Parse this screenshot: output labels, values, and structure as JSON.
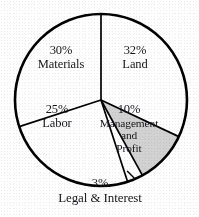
{
  "chart_data": {
    "type": "pie",
    "title": "",
    "subtitle": "",
    "xlabel": "",
    "ylabel": "",
    "legend_position": "none",
    "grid": false,
    "labels_inside": true,
    "total": 100,
    "units": "percent",
    "categories": [
      "Land",
      "Management and Profit",
      "Legal & Interest",
      "Labor",
      "Materials"
    ],
    "values": [
      32,
      10,
      3,
      25,
      30
    ],
    "start_angle_deg": 0,
    "direction": "clockwise",
    "slices": [
      {
        "name": "Land",
        "percent_text": "32%",
        "label_text": "Land",
        "value": 32,
        "fill": "#ffffff",
        "stroke": "#000000",
        "label_position": "inside"
      },
      {
        "name": "Management and Profit",
        "percent_text": "10%",
        "label_text": "Management and Profit",
        "label_line1": "Management",
        "label_line2": "and",
        "label_line3": "Profit",
        "value": 10,
        "fill": "#d2d2d2",
        "stroke": "#000000",
        "label_position": "inside"
      },
      {
        "name": "Legal & Interest",
        "percent_text": "3%",
        "label_text": "Legal & Interest",
        "value": 3,
        "fill": "#ffffff",
        "stroke": "#000000",
        "label_position": "outside-bottom"
      },
      {
        "name": "Labor",
        "percent_text": "25%",
        "label_text": "Labor",
        "value": 25,
        "fill": "#ffffff",
        "stroke": "#000000",
        "label_position": "inside"
      },
      {
        "name": "Materials",
        "percent_text": "30%",
        "label_text": "Materials",
        "value": 30,
        "fill": "#ffffff",
        "stroke": "#000000",
        "label_position": "inside"
      }
    ],
    "colors": {
      "background": "#ffffff",
      "outline": "#000000",
      "shaded_slice": "#d2d2d2",
      "text": "#16161a"
    },
    "geometry": {
      "center_x": 101,
      "center_y": 100,
      "radius": 86
    }
  }
}
